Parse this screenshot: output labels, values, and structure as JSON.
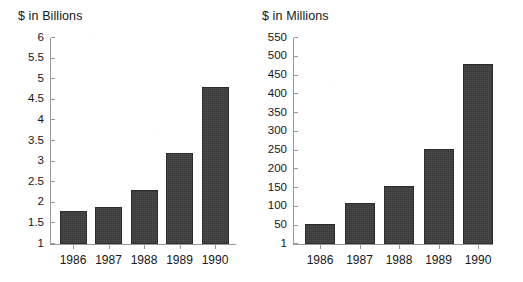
{
  "figure": {
    "background_color": "#ffffff",
    "bar_color": "#3d3d3d",
    "axis_color": "#9a9a9a",
    "text_color": "#161616"
  },
  "chart_data": [
    {
      "type": "bar",
      "title": "$ in Billions",
      "xlabel": "",
      "ylabel": "",
      "categories": [
        "1986",
        "1987",
        "1988",
        "1989",
        "1990"
      ],
      "values": [
        1.8,
        1.9,
        2.3,
        3.2,
        4.8
      ],
      "ylim": [
        1,
        6
      ],
      "yticks": [
        1,
        1.5,
        2,
        2.5,
        3,
        3.5,
        4,
        4.5,
        5,
        5.5,
        6
      ],
      "ytick_labels": [
        "1",
        "1.5",
        "2",
        "2.5",
        "3",
        "3.5",
        "4",
        "4.5",
        "5",
        "5.5",
        "6"
      ],
      "grid": false,
      "legend": false
    },
    {
      "type": "bar",
      "title": "$ in Millions",
      "xlabel": "",
      "ylabel": "",
      "categories": [
        "1986",
        "1987",
        "1988",
        "1989",
        "1990"
      ],
      "values": [
        55,
        110,
        155,
        255,
        480
      ],
      "ylim": [
        1,
        550
      ],
      "yticks": [
        1,
        50,
        100,
        150,
        200,
        250,
        300,
        350,
        400,
        450,
        500,
        550
      ],
      "ytick_labels": [
        "1",
        "50",
        "100",
        "150",
        "200",
        "250",
        "300",
        "350",
        "400",
        "450",
        "500",
        "550"
      ],
      "grid": false,
      "legend": false
    }
  ]
}
